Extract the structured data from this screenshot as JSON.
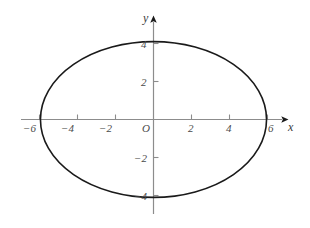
{
  "chart_data": {
    "type": "line",
    "title": "",
    "subtitle": "",
    "xlabel": "x",
    "ylabel": "y",
    "xlim": [
      -6.9,
      7.1
    ],
    "ylim": [
      -5.1,
      5.4
    ],
    "grid": false,
    "legend": null,
    "axes_style": {
      "axis_color": "#8c8c8c",
      "curve_color": "#1a1a1a",
      "label_color": "#4a4a4a",
      "background": "#ffffff",
      "arrowheads": true,
      "tick_direction": "inward"
    },
    "origin_label": "O",
    "x_ticks": [
      {
        "value": -6,
        "label": "−6"
      },
      {
        "value": -4,
        "label": "−4"
      },
      {
        "value": -2,
        "label": "−2"
      },
      {
        "value": 2,
        "label": "2"
      },
      {
        "value": 4,
        "label": "4"
      },
      {
        "value": 6,
        "label": "6"
      }
    ],
    "y_ticks": [
      {
        "value": 4,
        "label": "4"
      },
      {
        "value": 2,
        "label": "2"
      },
      {
        "value": -2,
        "label": "−2"
      },
      {
        "value": -4,
        "label": "−4"
      }
    ],
    "series": [
      {
        "name": "ellipse",
        "shape": "ellipse",
        "center": [
          0,
          0
        ],
        "semi_axis_x": 5.95,
        "semi_axis_y": 4.1,
        "vertices": [
          [
            -5.95,
            0
          ],
          [
            5.95,
            0
          ],
          [
            0,
            4.1
          ],
          [
            0,
            -4.1
          ]
        ],
        "closed": true,
        "stroke_width": 1.6
      }
    ]
  }
}
